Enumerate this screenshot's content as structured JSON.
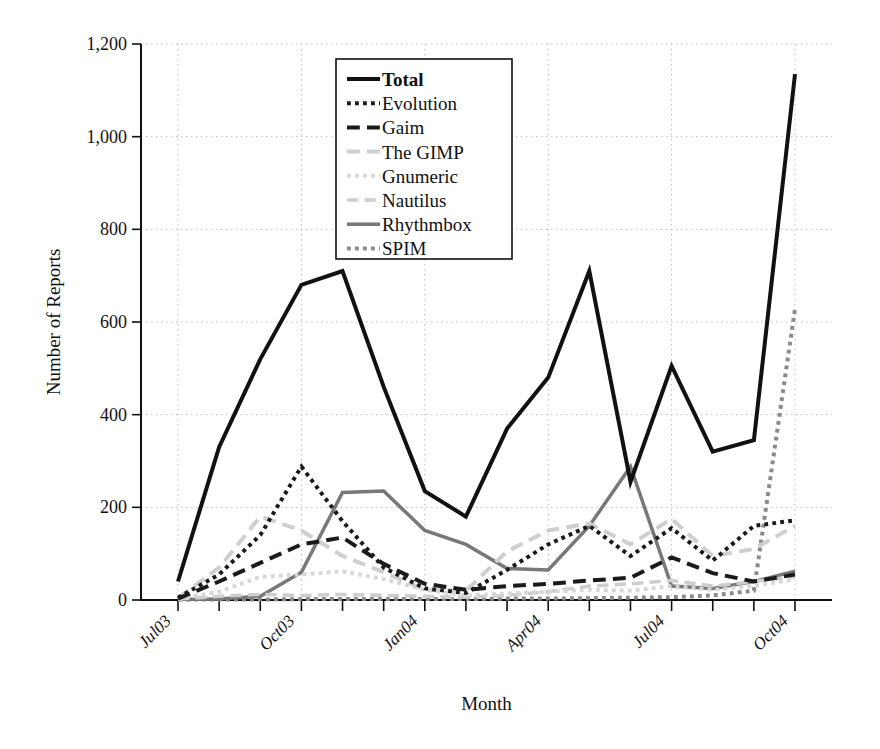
{
  "chart_data": {
    "type": "line",
    "title": "",
    "xlabel": "Month",
    "ylabel": "Number of Reports",
    "ylim": [
      0,
      1200
    ],
    "yticks": [
      0,
      200,
      400,
      600,
      800,
      1000,
      1200
    ],
    "ytick_labels": [
      "0",
      "200",
      "400",
      "600",
      "800",
      "1,000",
      "1,200"
    ],
    "grid": true,
    "legend_position": "upper center",
    "x": [
      "Jul03",
      "Aug03",
      "Sep03",
      "Oct03",
      "Nov03",
      "Dec03",
      "Jan04",
      "Feb04",
      "Mar04",
      "Apr04",
      "May04",
      "Jun04",
      "Jul04",
      "Aug04",
      "Sep04",
      "Oct04"
    ],
    "xtick_labels": [
      "Jul03",
      "",
      "",
      "Oct03",
      "",
      "",
      "Jan04",
      "",
      "",
      "Apr04",
      "",
      "",
      "Jul04",
      "",
      "",
      "Oct04"
    ],
    "series": [
      {
        "name": "Total",
        "color": "#111111",
        "style": "solid",
        "width": 4.0,
        "values": [
          40,
          330,
          520,
          680,
          710,
          460,
          235,
          180,
          370,
          480,
          710,
          255,
          505,
          320,
          345,
          1135
        ]
      },
      {
        "name": "Evolution",
        "color": "#1a1a1a",
        "style": "dotted",
        "width": 4.0,
        "values": [
          5,
          55,
          140,
          288,
          170,
          70,
          25,
          15,
          65,
          120,
          160,
          95,
          155,
          85,
          160,
          172
        ]
      },
      {
        "name": "Gaim",
        "color": "#1a1a1a",
        "style": "dashed",
        "width": 4.0,
        "values": [
          3,
          40,
          80,
          120,
          135,
          78,
          35,
          22,
          30,
          35,
          42,
          48,
          92,
          58,
          40,
          55
        ]
      },
      {
        "name": "The GIMP",
        "color": "#cfcfcf",
        "style": "dashed",
        "width": 4.0,
        "values": [
          4,
          70,
          180,
          150,
          95,
          60,
          22,
          20,
          105,
          150,
          165,
          120,
          175,
          95,
          110,
          160
        ]
      },
      {
        "name": "Gnumeric",
        "color": "#d7d7d7",
        "style": "dotted",
        "width": 4.0,
        "values": [
          2,
          18,
          50,
          55,
          62,
          45,
          22,
          10,
          14,
          18,
          22,
          20,
          30,
          22,
          30,
          45
        ]
      },
      {
        "name": "Nautilus",
        "color": "#cdcdcd",
        "style": "dashed",
        "width": 3.5,
        "values": [
          2,
          8,
          12,
          10,
          12,
          10,
          8,
          6,
          10,
          18,
          30,
          35,
          42,
          30,
          40,
          50
        ]
      },
      {
        "name": "Rhythmbox",
        "color": "#787878",
        "style": "solid",
        "width": 3.5,
        "values": [
          1,
          2,
          8,
          60,
          232,
          235,
          150,
          120,
          68,
          65,
          160,
          288,
          30,
          25,
          40,
          62
        ]
      },
      {
        "name": "SPIM",
        "color": "#8a8a8a",
        "style": "dotted",
        "width": 4.0,
        "values": [
          1,
          1,
          1,
          2,
          2,
          2,
          2,
          2,
          3,
          3,
          4,
          5,
          6,
          10,
          20,
          628
        ]
      }
    ]
  },
  "axis": {
    "ylabel": "Number of Reports",
    "xlabel": "Month"
  },
  "legend": {
    "entries": [
      {
        "label": "Total"
      },
      {
        "label": "Evolution"
      },
      {
        "label": "Gaim"
      },
      {
        "label": "The GIMP"
      },
      {
        "label": "Gnumeric"
      },
      {
        "label": "Nautilus"
      },
      {
        "label": "Rhythmbox"
      },
      {
        "label": "SPIM"
      }
    ]
  }
}
